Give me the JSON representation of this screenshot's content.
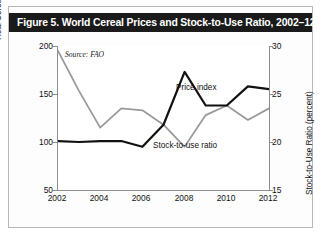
{
  "figure": {
    "title": "Figure 5. World Cereal Prices and Stock-to-Use Ratio, 2002–12",
    "source_note": "Source: FAO",
    "title_bar_color": "#1a1a1a",
    "title_text_color": "#ffffff",
    "background_color": "#ffffff"
  },
  "chart_data": {
    "type": "line",
    "title": "Figure 5. World Cereal Prices and Stock-to-Use Ratio, 2002–12",
    "subtitle": "",
    "annotations": [
      "Source: FAO"
    ],
    "xlabel": "",
    "x": [
      2002,
      2003,
      2004,
      2005,
      2006,
      2007,
      2008,
      2009,
      2010,
      2011,
      2012
    ],
    "xticks": [
      "2002",
      "2004",
      "2006",
      "2008",
      "2010",
      "2012"
    ],
    "xlim": [
      2002,
      2012
    ],
    "grid": false,
    "legend": "inline-labels",
    "axes": [
      {
        "side": "left",
        "label": "Real Cereals Price Index (2002–04 = 100)",
        "ticks": [
          "200",
          "150",
          "100",
          "50"
        ],
        "lim": [
          50,
          200
        ]
      },
      {
        "side": "right",
        "label": "Stock-to-Use Ratio (percent)",
        "ticks": [
          "30",
          "25",
          "20",
          "15"
        ],
        "lim": [
          15,
          30
        ]
      }
    ],
    "series": [
      {
        "name": "Price index",
        "axis": "left",
        "color": "#111111",
        "width": 2.2,
        "values": [
          101,
          100,
          101,
          101,
          95,
          118,
          173,
          138,
          138,
          158,
          155
        ]
      },
      {
        "name": "Stock-to-use ratio",
        "axis": "right",
        "color": "#9a9a9a",
        "width": 1.8,
        "values": [
          29.5,
          25.3,
          21.5,
          23.5,
          23.3,
          21.8,
          19.5,
          22.8,
          23.8,
          22.3,
          23.5
        ]
      }
    ]
  }
}
